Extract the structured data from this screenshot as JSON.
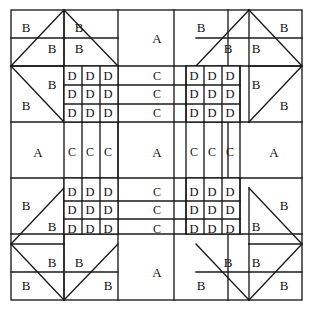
{
  "diagram": {
    "kind": "patchwork-block-layout",
    "stroke_color": "#1a1a1a",
    "fill_color": "#ffffff",
    "canvas": {
      "width": 314,
      "height": 312
    },
    "frame": {
      "x": 11,
      "y": 10,
      "width": 291,
      "height": 290
    },
    "band_x": [
      11,
      64,
      118,
      174,
      228,
      302
    ],
    "band_y": [
      10,
      66,
      122,
      178,
      234,
      300
    ],
    "patch_codes": [
      "A",
      "B",
      "C",
      "D"
    ],
    "labels": {
      "a": "A",
      "b": "B",
      "c": "C",
      "d": "D"
    },
    "corner_units": [
      {
        "name": "top-left",
        "cells": [
          "B",
          "B",
          "B",
          "B",
          "B",
          "B"
        ]
      },
      {
        "name": "top-right",
        "cells": [
          "B",
          "B",
          "B",
          "B",
          "B",
          "B"
        ]
      },
      {
        "name": "bottom-left",
        "cells": [
          "B",
          "B",
          "B",
          "B",
          "B",
          "B"
        ]
      },
      {
        "name": "bottom-right",
        "cells": [
          "B",
          "B",
          "B",
          "B",
          "B",
          "B"
        ]
      }
    ],
    "d_blocks": [
      {
        "name": "upper-left-d-grid",
        "rows": [
          [
            "D",
            "D",
            "D"
          ],
          [
            "D",
            "D",
            "D"
          ],
          [
            "D",
            "D",
            "D"
          ]
        ]
      },
      {
        "name": "upper-right-d-grid",
        "rows": [
          [
            "D",
            "D",
            "D"
          ],
          [
            "D",
            "D",
            "D"
          ],
          [
            "D",
            "D",
            "D"
          ]
        ]
      },
      {
        "name": "lower-left-d-grid",
        "rows": [
          [
            "D",
            "D",
            "D"
          ],
          [
            "D",
            "D",
            "D"
          ],
          [
            "D",
            "D",
            "D"
          ]
        ]
      },
      {
        "name": "lower-right-d-grid",
        "rows": [
          [
            "D",
            "D",
            "D"
          ],
          [
            "D",
            "D",
            "D"
          ],
          [
            "D",
            "D",
            "D"
          ]
        ]
      }
    ],
    "c_columns_top": [
      "C",
      "C",
      "C"
    ],
    "c_columns_bottom": [
      "C",
      "C",
      "C"
    ],
    "c_row_left": [
      "C",
      "C",
      "C"
    ],
    "c_row_right": [
      "C",
      "C",
      "C"
    ],
    "a_patches": [
      {
        "name": "top-center-a",
        "label": "A"
      },
      {
        "name": "middle-left-a",
        "label": "A"
      },
      {
        "name": "center-a",
        "label": "A"
      },
      {
        "name": "middle-right-a",
        "label": "A"
      },
      {
        "name": "bottom-center-a",
        "label": "A"
      }
    ],
    "text_cells": [
      {
        "id": "tl-b1",
        "label": "B",
        "x": 26,
        "y": 27
      },
      {
        "id": "tl-b2",
        "label": "B",
        "x": 52,
        "y": 48
      },
      {
        "id": "tl-b3",
        "label": "B",
        "x": 79,
        "y": 27
      },
      {
        "id": "tl-b4",
        "label": "B",
        "x": 79,
        "y": 48
      },
      {
        "id": "tl-b5",
        "label": "B",
        "x": 26,
        "y": 105
      },
      {
        "id": "tl-b6",
        "label": "B",
        "x": 52,
        "y": 84
      },
      {
        "id": "tc-a",
        "label": "A",
        "x": 157,
        "y": 38
      },
      {
        "id": "tr-b1",
        "label": "B",
        "x": 201,
        "y": 27
      },
      {
        "id": "tr-b2",
        "label": "B",
        "x": 228,
        "y": 48
      },
      {
        "id": "tr-b3",
        "label": "B",
        "x": 256,
        "y": 48
      },
      {
        "id": "tr-b4",
        "label": "B",
        "x": 284,
        "y": 27
      },
      {
        "id": "tr-b5",
        "label": "B",
        "x": 256,
        "y": 84
      },
      {
        "id": "tr-b6",
        "label": "B",
        "x": 284,
        "y": 105
      },
      {
        "id": "dtl-r1c1",
        "label": "D",
        "x": 72,
        "y": 76
      },
      {
        "id": "dtl-r1c2",
        "label": "D",
        "x": 90,
        "y": 76
      },
      {
        "id": "dtl-r1c3",
        "label": "D",
        "x": 108,
        "y": 76
      },
      {
        "id": "dtl-r2c1",
        "label": "D",
        "x": 72,
        "y": 94
      },
      {
        "id": "dtl-r2c2",
        "label": "D",
        "x": 90,
        "y": 94
      },
      {
        "id": "dtl-r2c3",
        "label": "D",
        "x": 108,
        "y": 94
      },
      {
        "id": "dtl-r3c1",
        "label": "D",
        "x": 72,
        "y": 113
      },
      {
        "id": "dtl-r3c2",
        "label": "D",
        "x": 90,
        "y": 113
      },
      {
        "id": "dtl-r3c3",
        "label": "D",
        "x": 108,
        "y": 113
      },
      {
        "id": "ct-r1",
        "label": "C",
        "x": 157,
        "y": 76
      },
      {
        "id": "ct-r2",
        "label": "C",
        "x": 157,
        "y": 94
      },
      {
        "id": "ct-r3",
        "label": "C",
        "x": 157,
        "y": 113
      },
      {
        "id": "dtr-r1c1",
        "label": "D",
        "x": 194,
        "y": 76
      },
      {
        "id": "dtr-r1c2",
        "label": "D",
        "x": 212,
        "y": 76
      },
      {
        "id": "dtr-r1c3",
        "label": "D",
        "x": 230,
        "y": 76
      },
      {
        "id": "dtr-r2c1",
        "label": "D",
        "x": 194,
        "y": 94
      },
      {
        "id": "dtr-r2c2",
        "label": "D",
        "x": 212,
        "y": 94
      },
      {
        "id": "dtr-r2c3",
        "label": "D",
        "x": 230,
        "y": 94
      },
      {
        "id": "dtr-r3c1",
        "label": "D",
        "x": 194,
        "y": 113
      },
      {
        "id": "dtr-r3c2",
        "label": "D",
        "x": 212,
        "y": 113
      },
      {
        "id": "dtr-r3c3",
        "label": "D",
        "x": 230,
        "y": 113
      },
      {
        "id": "ml-a",
        "label": "A",
        "x": 38,
        "y": 152
      },
      {
        "id": "mc-c1",
        "label": "C",
        "x": 72,
        "y": 152
      },
      {
        "id": "mc-c2",
        "label": "C",
        "x": 90,
        "y": 152
      },
      {
        "id": "mc-c3",
        "label": "C",
        "x": 108,
        "y": 152
      },
      {
        "id": "mc-a",
        "label": "A",
        "x": 157,
        "y": 152
      },
      {
        "id": "mr-c1",
        "label": "C",
        "x": 194,
        "y": 152
      },
      {
        "id": "mr-c2",
        "label": "C",
        "x": 212,
        "y": 152
      },
      {
        "id": "mr-c3",
        "label": "C",
        "x": 230,
        "y": 152
      },
      {
        "id": "mr-a",
        "label": "A",
        "x": 274,
        "y": 152
      },
      {
        "id": "dbl-r1c1",
        "label": "D",
        "x": 72,
        "y": 192
      },
      {
        "id": "dbl-r1c2",
        "label": "D",
        "x": 90,
        "y": 192
      },
      {
        "id": "dbl-r1c3",
        "label": "D",
        "x": 108,
        "y": 192
      },
      {
        "id": "dbl-r2c1",
        "label": "D",
        "x": 72,
        "y": 210
      },
      {
        "id": "dbl-r2c2",
        "label": "D",
        "x": 90,
        "y": 210
      },
      {
        "id": "dbl-r2c3",
        "label": "D",
        "x": 108,
        "y": 210
      },
      {
        "id": "dbl-r3c1",
        "label": "D",
        "x": 72,
        "y": 229
      },
      {
        "id": "dbl-r3c2",
        "label": "D",
        "x": 90,
        "y": 229
      },
      {
        "id": "dbl-r3c3",
        "label": "D",
        "x": 108,
        "y": 229
      },
      {
        "id": "cb-r1",
        "label": "C",
        "x": 157,
        "y": 192
      },
      {
        "id": "cb-r2",
        "label": "C",
        "x": 157,
        "y": 210
      },
      {
        "id": "cb-r3",
        "label": "C",
        "x": 157,
        "y": 229
      },
      {
        "id": "dbr-r1c1",
        "label": "D",
        "x": 194,
        "y": 192
      },
      {
        "id": "dbr-r1c2",
        "label": "D",
        "x": 212,
        "y": 192
      },
      {
        "id": "dbr-r1c3",
        "label": "D",
        "x": 230,
        "y": 192
      },
      {
        "id": "dbr-r2c1",
        "label": "D",
        "x": 194,
        "y": 210
      },
      {
        "id": "dbr-r2c2",
        "label": "D",
        "x": 212,
        "y": 210
      },
      {
        "id": "dbr-r2c3",
        "label": "D",
        "x": 230,
        "y": 210
      },
      {
        "id": "dbr-r3c1",
        "label": "D",
        "x": 194,
        "y": 229
      },
      {
        "id": "dbr-r3c2",
        "label": "D",
        "x": 212,
        "y": 229
      },
      {
        "id": "dbr-r3c3",
        "label": "D",
        "x": 230,
        "y": 229
      },
      {
        "id": "bl-b1",
        "label": "B",
        "x": 26,
        "y": 205
      },
      {
        "id": "bl-b2",
        "label": "B",
        "x": 52,
        "y": 226
      },
      {
        "id": "bl-b3",
        "label": "B",
        "x": 52,
        "y": 262
      },
      {
        "id": "bl-b4",
        "label": "B",
        "x": 79,
        "y": 262
      },
      {
        "id": "bl-b5",
        "label": "B",
        "x": 26,
        "y": 285
      },
      {
        "id": "bl-b6",
        "label": "B",
        "x": 108,
        "y": 285
      },
      {
        "id": "bc-a",
        "label": "A",
        "x": 157,
        "y": 272
      },
      {
        "id": "br-b1",
        "label": "B",
        "x": 256,
        "y": 226
      },
      {
        "id": "br-b2",
        "label": "B",
        "x": 284,
        "y": 205
      },
      {
        "id": "br-b3",
        "label": "B",
        "x": 228,
        "y": 262
      },
      {
        "id": "br-b4",
        "label": "B",
        "x": 256,
        "y": 262
      },
      {
        "id": "br-b5",
        "label": "B",
        "x": 201,
        "y": 285
      },
      {
        "id": "br-b6",
        "label": "B",
        "x": 284,
        "y": 285
      }
    ]
  }
}
